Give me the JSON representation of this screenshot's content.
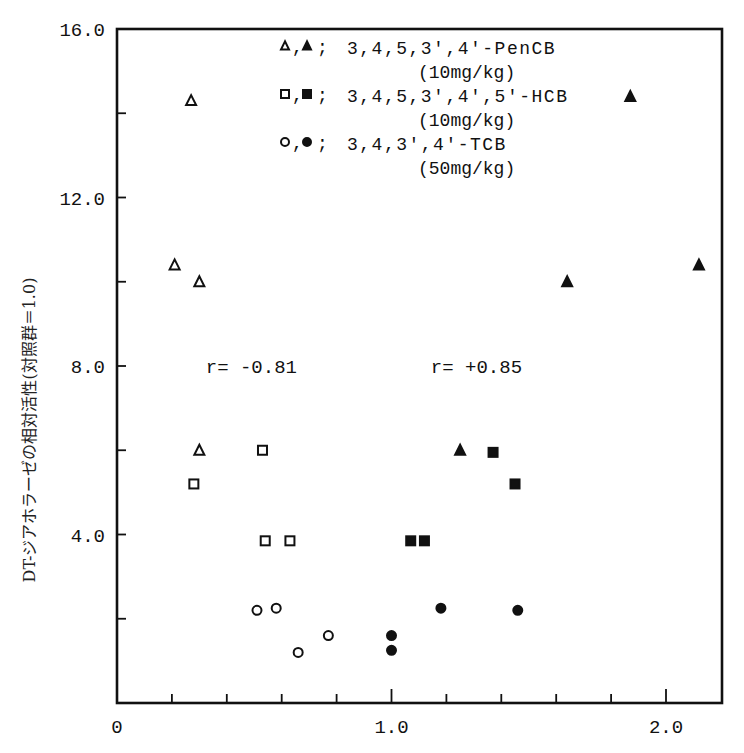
{
  "chart_data": {
    "type": "scatter",
    "title": "",
    "xlabel": "",
    "ylabel": "DT-ジアホラーゼの相対活性(対照群＝1.0)",
    "xlim": [
      0,
      2.2
    ],
    "ylim": [
      0,
      16.0
    ],
    "x_ticks": [
      0,
      0.2,
      0.4,
      0.6,
      0.8,
      1.0,
      1.2,
      1.4,
      1.6,
      1.8,
      2.0
    ],
    "x_tick_labels": {
      "0": "0",
      "1.0": "1.0",
      "2.0": "2.0"
    },
    "y_ticks": [
      0,
      2.0,
      4.0,
      6.0,
      8.0,
      10.0,
      12.0,
      14.0,
      16.0
    ],
    "y_tick_labels": {
      "4.0": "4.0",
      "8.0": "8.0",
      "12.0": "12.0",
      "16.0": "16.0"
    },
    "grid": false,
    "legend_position": "upper center (inside plot)",
    "legend": [
      {
        "markers": "△,▲;",
        "label": "3,4,5,3′,4′-PenCB",
        "dose": "(10mg/kg)"
      },
      {
        "markers": "□,■;",
        "label": "3,4,5,3′,4′,5′-HCB",
        "dose": "(10mg/kg)"
      },
      {
        "markers": "○,●;",
        "label": "3,4,3′,4′-TCB",
        "dose": "(50mg/kg)"
      }
    ],
    "annotations": [
      {
        "text": "r= -0.81",
        "x": 0.48,
        "y": 8.0
      },
      {
        "text": "r= +0.85",
        "x": 1.3,
        "y": 8.0
      }
    ],
    "series": [
      {
        "name": "3,4,5,3′,4′-PenCB (open)",
        "marker": "triangle-open",
        "points": [
          [
            0.27,
            14.3
          ],
          [
            0.21,
            10.4
          ],
          [
            0.3,
            10.0
          ],
          [
            0.3,
            6.0
          ]
        ]
      },
      {
        "name": "3,4,5,3′,4′-PenCB (filled)",
        "marker": "triangle-filled",
        "points": [
          [
            1.87,
            14.4
          ],
          [
            1.64,
            10.0
          ],
          [
            2.12,
            10.4
          ],
          [
            1.25,
            6.0
          ]
        ]
      },
      {
        "name": "3,4,5,3′,4′,5′-HCB (open)",
        "marker": "square-open",
        "points": [
          [
            0.53,
            6.0
          ],
          [
            0.28,
            5.2
          ],
          [
            0.54,
            3.85
          ],
          [
            0.63,
            3.85
          ]
        ]
      },
      {
        "name": "3,4,5,3′,4′,5′-HCB (filled)",
        "marker": "square-filled",
        "points": [
          [
            1.37,
            5.95
          ],
          [
            1.45,
            5.2
          ],
          [
            1.07,
            3.85
          ],
          [
            1.12,
            3.85
          ]
        ]
      },
      {
        "name": "3,4,3′,4′-TCB (open)",
        "marker": "circle-open",
        "points": [
          [
            0.51,
            2.2
          ],
          [
            0.58,
            2.25
          ],
          [
            0.66,
            1.2
          ],
          [
            0.77,
            1.6
          ]
        ]
      },
      {
        "name": "3,4,3′,4′-TCB (filled)",
        "marker": "circle-filled",
        "points": [
          [
            1.18,
            2.25
          ],
          [
            1.46,
            2.2
          ],
          [
            1.0,
            1.6
          ],
          [
            1.0,
            1.25
          ]
        ]
      }
    ]
  }
}
